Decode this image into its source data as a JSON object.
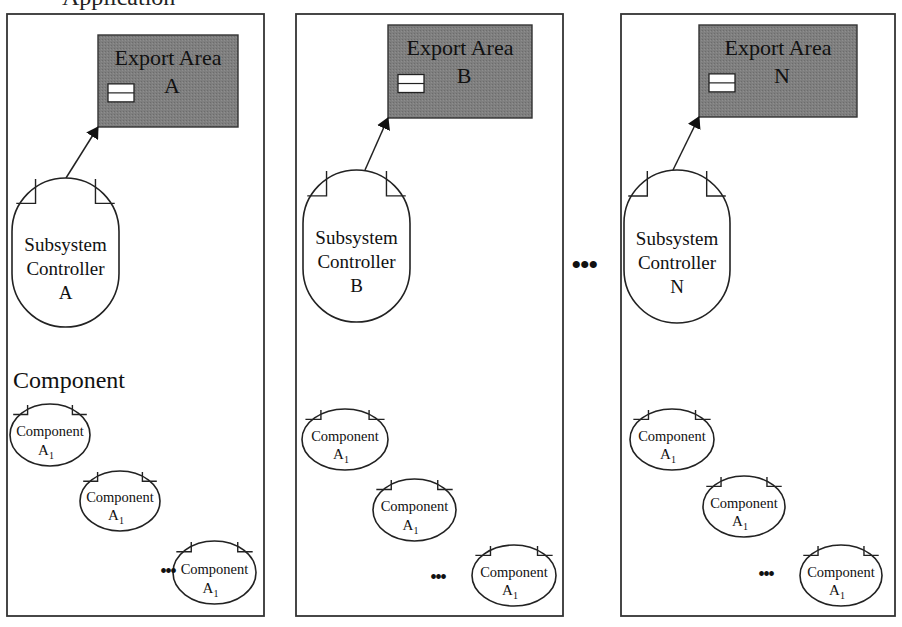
{
  "diagram": {
    "cut_title": "Application",
    "ellipsis_between_panels": "•••",
    "colors": {
      "export_area_fill": "#7d7d7d",
      "export_area_border": "#333333",
      "line": "#222222",
      "panel_border": "#333333",
      "background": "#ffffff"
    },
    "panels": [
      {
        "id": "A",
        "frame": {
          "x": 7,
          "y": 14,
          "w": 257,
          "h": 602
        },
        "export_area": {
          "label_line1": "Export Area",
          "label_line2": "A",
          "x": 98,
          "y": 35,
          "w": 140,
          "h": 92
        },
        "controller": {
          "line1": "Subsystem",
          "line2": "Controller",
          "line3": "A",
          "x": 12,
          "y": 178,
          "w": 107,
          "h": 149
        },
        "arrow": {
          "x1": 66,
          "y1": 178,
          "x2": 98,
          "y2": 127
        },
        "section_label": "Component",
        "components": [
          {
            "label": "Component",
            "subscript_base": "A",
            "subscript": "1",
            "x": 10,
            "y": 404,
            "w": 80,
            "h": 62
          },
          {
            "label": "Component",
            "subscript_base": "A",
            "subscript": "1",
            "x": 80,
            "y": 471,
            "w": 80,
            "h": 60
          },
          {
            "label": "Component",
            "subscript_base": "A",
            "subscript": "1",
            "x": 173,
            "y": 541,
            "w": 83,
            "h": 63
          }
        ],
        "dots": {
          "text": "•••",
          "x": 160,
          "y": 578
        }
      },
      {
        "id": "B",
        "frame": {
          "x": 296,
          "y": 14,
          "w": 267,
          "h": 602
        },
        "export_area": {
          "label_line1": "Export Area",
          "label_line2": "B",
          "x": 388,
          "y": 25,
          "w": 144,
          "h": 93
        },
        "controller": {
          "line1": "Subsystem",
          "line2": "Controller",
          "line3": "B",
          "x": 303,
          "y": 170,
          "w": 107,
          "h": 152
        },
        "arrow": {
          "x1": 365,
          "y1": 170,
          "x2": 388,
          "y2": 118
        },
        "section_label": "",
        "components": [
          {
            "label": "Component",
            "subscript_base": "A",
            "subscript": "1",
            "x": 302,
            "y": 409,
            "w": 86,
            "h": 61
          },
          {
            "label": "Component",
            "subscript_base": "A",
            "subscript": "1",
            "x": 373,
            "y": 479,
            "w": 83,
            "h": 62
          },
          {
            "label": "Component",
            "subscript_base": "A",
            "subscript": "1",
            "x": 472,
            "y": 545,
            "w": 84,
            "h": 61
          }
        ],
        "dots": {
          "text": "•••",
          "x": 430,
          "y": 584
        }
      },
      {
        "id": "N",
        "frame": {
          "x": 621,
          "y": 14,
          "w": 274,
          "h": 602
        },
        "export_area": {
          "label_line1": "Export Area",
          "label_line2": "N",
          "x": 699,
          "y": 25,
          "w": 158,
          "h": 92
        },
        "controller": {
          "line1": "Subsystem",
          "line2": "Controller",
          "line3": "N",
          "x": 624,
          "y": 170,
          "w": 106,
          "h": 153
        },
        "arrow": {
          "x1": 673,
          "y1": 170,
          "x2": 699,
          "y2": 117
        },
        "section_label": "",
        "components": [
          {
            "label": "Component",
            "subscript_base": "A",
            "subscript": "1",
            "x": 630,
            "y": 409,
            "w": 84,
            "h": 61
          },
          {
            "label": "Component",
            "subscript_base": "A",
            "subscript": "1",
            "x": 703,
            "y": 476,
            "w": 82,
            "h": 61
          },
          {
            "label": "Component",
            "subscript_base": "A",
            "subscript": "1",
            "x": 800,
            "y": 545,
            "w": 82,
            "h": 61
          }
        ],
        "dots": {
          "text": "•••",
          "x": 758,
          "y": 581
        }
      }
    ],
    "middle_ellipsis": {
      "text": "•••",
      "x": 571,
      "y": 275
    }
  }
}
